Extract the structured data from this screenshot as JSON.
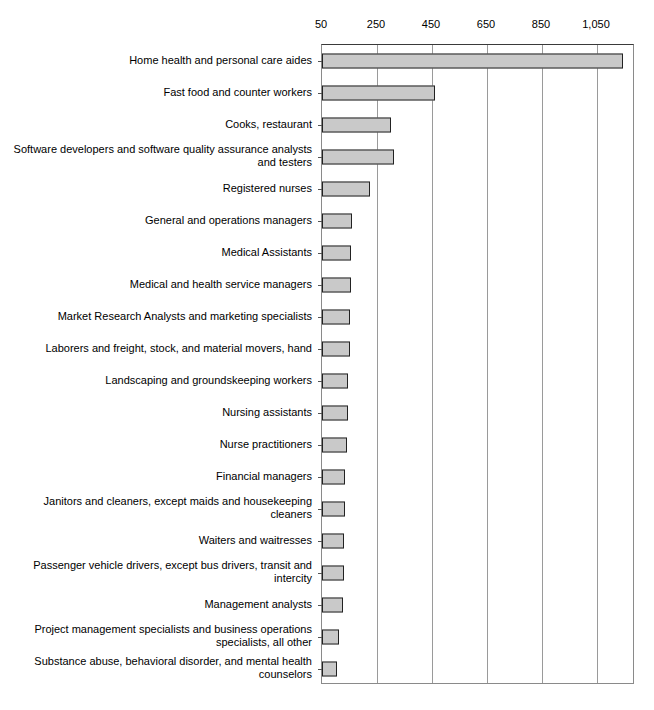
{
  "chart_data": {
    "type": "bar",
    "orientation": "horizontal",
    "title": "",
    "subtitle": "",
    "xlabel": "",
    "ylabel": "",
    "xlim": [
      50,
      1200
    ],
    "axis_start_value": 50,
    "grid": true,
    "legend": null,
    "tick_labels": [
      "50",
      "250",
      "450",
      "650",
      "850",
      "1,050"
    ],
    "tick_values": [
      50,
      250,
      450,
      650,
      850,
      1050
    ],
    "bar_color": "#c9c9c9",
    "bar_border_color": "#222222",
    "categories": [
      "Home health and personal care aides",
      "Fast food and counter workers",
      "Cooks, restaurant",
      "Software developers and software quality assurance analysts and testers",
      "Registered nurses",
      "General and operations managers",
      "Medical Assistants",
      "Medical and health service managers",
      "Market Research Analysts and marketing specialists",
      "Laborers and freight, stock, and material movers, hand",
      "Landscaping and groundskeeping workers",
      "Nursing assistants",
      "Nurse practitioners",
      "Financial managers",
      "Janitors and cleaners, except maids and housekeeping cleaners",
      "Waiters and waitresses",
      "Passenger vehicle drivers, except bus drivers, transit and intercity",
      "Management analysts",
      "Project management specialists and business operations specialists, all other",
      "Substance abuse, behavioral disorder, and mental health counselors"
    ],
    "values": [
      1145,
      460,
      300,
      310,
      225,
      160,
      155,
      155,
      150,
      150,
      145,
      145,
      140,
      135,
      135,
      130,
      130,
      125,
      110,
      105
    ]
  }
}
